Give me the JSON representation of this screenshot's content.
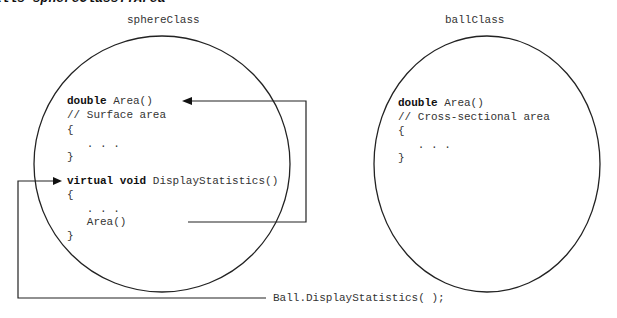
{
  "caption": "calls sphereClass::Area",
  "sphere": {
    "title": "sphereClass",
    "area_kw": "double",
    "area_sig": " Area()",
    "area_comment": "// Surface area",
    "open1": "{",
    "dots1": "   . . .",
    "close1": "}",
    "display_kw": "virtual void",
    "display_sig": " DisplayStatistics()",
    "open2": "{",
    "dots2": "   . . .",
    "area_call": "   Area()",
    "close2": "}"
  },
  "ball": {
    "title": "ballClass",
    "area_kw": "double",
    "area_sig": " Area()",
    "area_comment": "// Cross-sectional area",
    "open": "{",
    "dots": "   . . .",
    "close": "}"
  },
  "call": {
    "text": "Ball.DisplayStatistics( );"
  }
}
